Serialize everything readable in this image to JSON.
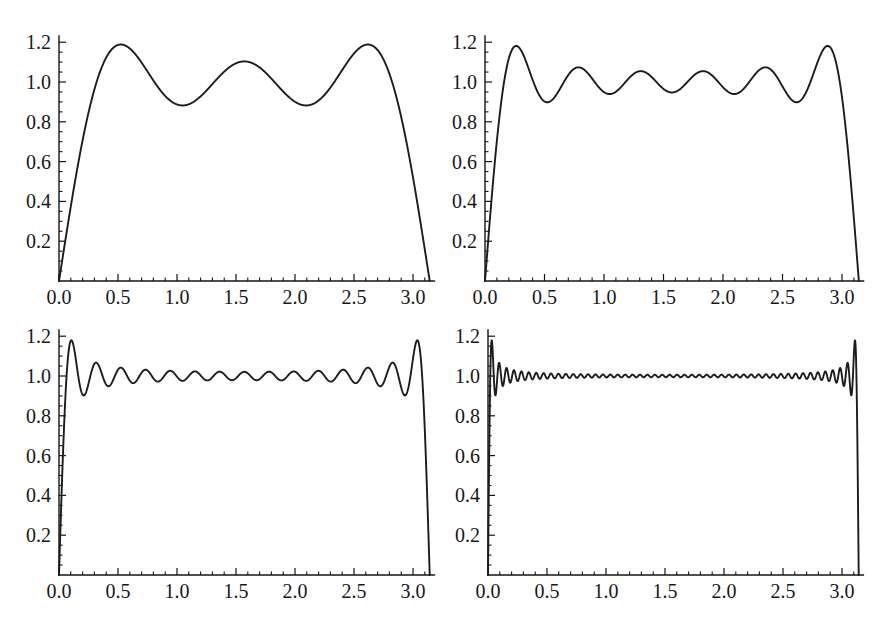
{
  "figure": {
    "layout": "2x2 grid of line plots",
    "background": "#ffffff"
  },
  "colors": {
    "curve": "#1c1c1c",
    "axis": "#141414",
    "tick": "#141414",
    "text": "#171717",
    "background": "#ffffff"
  },
  "chart_data": [
    {
      "type": "line",
      "position": "top-left",
      "title": "",
      "xlabel": "",
      "ylabel": "",
      "series": [
        {
          "name": "S3",
          "function": "f(x) = (4/pi) * sum_{k=1..3} sin((2k-1)x)/(2k-1)",
          "terms": 3,
          "highest_harmonic": 5
        }
      ],
      "x_range": [
        0,
        3.14159265
      ],
      "xlim": [
        0,
        3.2
      ],
      "ylim": [
        0,
        1.25
      ],
      "x_tick_values": [
        0,
        0.5,
        1.0,
        1.5,
        2.0,
        2.5,
        3.0
      ],
      "x_tick_labels": [
        "0.0",
        "0.5",
        "1.0",
        "1.5",
        "2.0",
        "2.5",
        "3.0"
      ],
      "y_tick_values": [
        0.2,
        0.4,
        0.6,
        0.8,
        1.0,
        1.2
      ],
      "y_tick_labels": [
        "0.2",
        "0.4",
        "0.6",
        "0.8",
        "1.0",
        "1.2"
      ],
      "x_minor_step": 0.1,
      "y_minor_step": 0.05,
      "grid": false,
      "legend": null,
      "features": {
        "local_maxima_count": 3,
        "first_peak": {
          "x": 0.52,
          "y": 1.19
        },
        "middle_peak": {
          "x": 1.57,
          "y": 1.1
        },
        "minima_value": 0.88,
        "converges_to": 1.0,
        "endpoints_value": 0
      }
    },
    {
      "type": "line",
      "position": "top-right",
      "title": "",
      "xlabel": "",
      "ylabel": "",
      "series": [
        {
          "name": "S6",
          "function": "f(x) = (4/pi) * sum_{k=1..6} sin((2k-1)x)/(2k-1)",
          "terms": 6,
          "highest_harmonic": 11
        }
      ],
      "x_range": [
        0,
        3.14159265
      ],
      "xlim": [
        0,
        3.2
      ],
      "ylim": [
        0,
        1.25
      ],
      "x_tick_values": [
        0,
        0.5,
        1.0,
        1.5,
        2.0,
        2.5,
        3.0
      ],
      "x_tick_labels": [
        "0.0",
        "0.5",
        "1.0",
        "1.5",
        "2.0",
        "2.5",
        "3.0"
      ],
      "y_tick_values": [
        0.2,
        0.4,
        0.6,
        0.8,
        1.0,
        1.2
      ],
      "y_tick_labels": [
        "0.2",
        "0.4",
        "0.6",
        "0.8",
        "1.0",
        "1.2"
      ],
      "x_minor_step": 0.1,
      "y_minor_step": 0.05,
      "grid": false,
      "legend": null,
      "features": {
        "local_maxima_count": 6,
        "first_peak": {
          "x": 0.26,
          "y": 1.18
        },
        "middle_peaks_value": 1.05,
        "minima_value": 0.9,
        "converges_to": 1.0,
        "endpoints_value": 0
      }
    },
    {
      "type": "line",
      "position": "bottom-left",
      "title": "",
      "xlabel": "",
      "ylabel": "",
      "series": [
        {
          "name": "S15",
          "function": "f(x) = (4/pi) * sum_{k=1..15} sin((2k-1)x)/(2k-1)",
          "terms": 15,
          "highest_harmonic": 29
        }
      ],
      "x_range": [
        0,
        3.14159265
      ],
      "xlim": [
        0,
        3.2
      ],
      "ylim": [
        0,
        1.25
      ],
      "x_tick_values": [
        0,
        0.5,
        1.0,
        1.5,
        2.0,
        2.5,
        3.0
      ],
      "x_tick_labels": [
        "0.0",
        "0.5",
        "1.0",
        "1.5",
        "2.0",
        "2.5",
        "3.0"
      ],
      "y_tick_values": [
        0.2,
        0.4,
        0.6,
        0.8,
        1.0,
        1.2
      ],
      "y_tick_labels": [
        "0.2",
        "0.4",
        "0.6",
        "0.8",
        "1.0",
        "1.2"
      ],
      "x_minor_step": 0.1,
      "y_minor_step": 0.05,
      "grid": false,
      "legend": null,
      "features": {
        "local_maxima_count": 15,
        "first_peak": {
          "x": 0.1,
          "y": 1.18
        },
        "ripple_about": 1.0,
        "converges_to": 1.0,
        "endpoints_value": 0
      }
    },
    {
      "type": "line",
      "position": "bottom-right",
      "title": "",
      "xlabel": "",
      "ylabel": "",
      "series": [
        {
          "name": "S50",
          "function": "f(x) = (4/pi) * sum_{k=1..50} sin((2k-1)x)/(2k-1)",
          "terms": 50,
          "highest_harmonic": 99
        }
      ],
      "x_range": [
        0,
        3.14159265
      ],
      "xlim": [
        0,
        3.2
      ],
      "ylim": [
        0,
        1.25
      ],
      "x_tick_values": [
        0,
        0.5,
        1.0,
        1.5,
        2.0,
        2.5,
        3.0
      ],
      "x_tick_labels": [
        "0.0",
        "0.5",
        "1.0",
        "1.5",
        "2.0",
        "2.5",
        "3.0"
      ],
      "y_tick_values": [
        0.2,
        0.4,
        0.6,
        0.8,
        1.0,
        1.2
      ],
      "y_tick_labels": [
        "0.2",
        "0.4",
        "0.6",
        "0.8",
        "1.0",
        "1.2"
      ],
      "x_minor_step": 0.1,
      "y_minor_step": 0.05,
      "grid": false,
      "legend": null,
      "features": {
        "local_maxima_count": 50,
        "first_peak": {
          "x": 0.031,
          "y": 1.18
        },
        "ripple_about": 1.0,
        "converges_to": 1.0,
        "endpoints_value": 0
      }
    }
  ]
}
